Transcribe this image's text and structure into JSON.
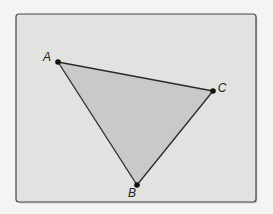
{
  "diagram": {
    "type": "triangle",
    "vertices": [
      {
        "id": "A",
        "label": "A"
      },
      {
        "id": "B",
        "label": "B"
      },
      {
        "id": "C",
        "label": "C"
      }
    ],
    "edges": [
      [
        "A",
        "B"
      ],
      [
        "B",
        "C"
      ],
      [
        "C",
        "A"
      ]
    ],
    "colors": {
      "page_background": "#f4f4f2",
      "panel_fill": "#e2e2e0",
      "panel_border": "#444444",
      "triangle_fill": "#c9c9c7",
      "stroke": "#2a2a2a",
      "point": "#111111"
    }
  }
}
